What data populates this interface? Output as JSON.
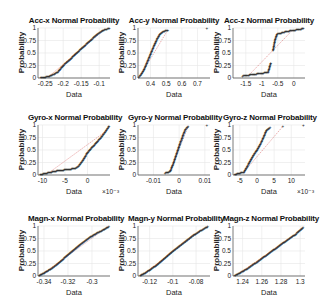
{
  "figure": {
    "background": "#ffffff",
    "grid_color": "#e6e6e6",
    "marker_color": "#222222",
    "ref_line_color": "#cc3333"
  },
  "chart_data": [
    {
      "type": "scatter",
      "title": "Acc-x Normal Probability",
      "xlabel": "Data",
      "ylabel": "Probability",
      "x_ticks": [
        "-0.25",
        "-0.2",
        "-0.15",
        "-0.1"
      ],
      "y_ticks": [
        "0",
        "0.25",
        "0.5",
        "0.75",
        "1"
      ],
      "xlim": [
        -0.27,
        -0.07
      ],
      "x_exponent": "",
      "grid": true,
      "points": [
        [
          -0.262,
          0.01
        ],
        [
          -0.24,
          0.03
        ],
        [
          -0.225,
          0.08
        ],
        [
          -0.215,
          0.12
        ],
        [
          -0.2,
          0.25
        ],
        [
          -0.18,
          0.38
        ],
        [
          -0.16,
          0.52
        ],
        [
          -0.14,
          0.65
        ],
        [
          -0.12,
          0.78
        ],
        [
          -0.105,
          0.88
        ],
        [
          -0.095,
          0.93
        ],
        [
          -0.085,
          0.97
        ],
        [
          -0.072,
          0.99
        ]
      ]
    },
    {
      "type": "scatter",
      "title": "Acc-y Normal Probability",
      "xlabel": "Data",
      "ylabel": "Probability",
      "x_ticks": [
        "0.4",
        "0.5",
        "0.6",
        "0.7"
      ],
      "y_ticks": [
        "0",
        "0.25",
        "0.5",
        "0.75",
        "1"
      ],
      "xlim": [
        0.32,
        0.78
      ],
      "x_exponent": "",
      "grid": true,
      "points": [
        [
          0.325,
          0.02
        ],
        [
          0.34,
          0.07
        ],
        [
          0.36,
          0.18
        ],
        [
          0.38,
          0.33
        ],
        [
          0.4,
          0.48
        ],
        [
          0.42,
          0.63
        ],
        [
          0.44,
          0.77
        ],
        [
          0.46,
          0.88
        ],
        [
          0.48,
          0.93
        ],
        [
          0.51,
          0.96
        ],
        [
          0.76,
          0.995
        ]
      ]
    },
    {
      "type": "scatter",
      "title": "Acc-z Normal Probability",
      "xlabel": "Data",
      "ylabel": "Probability",
      "x_ticks": [
        "-1.5",
        "-1",
        "-0.5",
        "0"
      ],
      "y_ticks": [
        "0",
        "0.25",
        "0.5",
        "0.75",
        "1"
      ],
      "xlim": [
        -1.9,
        0.35
      ],
      "x_exponent": "",
      "grid": true,
      "points": [
        [
          -1.6,
          0.04
        ],
        [
          -1.4,
          0.06
        ],
        [
          -1.2,
          0.08
        ],
        [
          -0.95,
          0.1
        ],
        [
          -0.8,
          0.12
        ],
        [
          -0.72,
          0.3
        ],
        [
          -0.65,
          0.55
        ],
        [
          -0.58,
          0.78
        ],
        [
          -0.52,
          0.88
        ],
        [
          -0.4,
          0.9
        ],
        [
          -0.25,
          0.93
        ],
        [
          -0.05,
          0.95
        ],
        [
          0.3,
          0.99
        ]
      ]
    },
    {
      "type": "scatter",
      "title": "Gyro-x Normal Probability",
      "xlabel": "Data",
      "ylabel": "Probability",
      "x_ticks": [
        "-10",
        "-5",
        "0"
      ],
      "y_ticks": [
        "0",
        "0.25",
        "0.5",
        "0.75",
        "1"
      ],
      "xlim": [
        -11,
        5
      ],
      "x_exponent": "×10⁻³",
      "grid": true,
      "points": [
        [
          -10.5,
          0.01
        ],
        [
          -8.5,
          0.05
        ],
        [
          -7,
          0.08
        ],
        [
          -5.5,
          0.1
        ],
        [
          -3.8,
          0.12
        ],
        [
          -2.8,
          0.13
        ],
        [
          -2,
          0.18
        ],
        [
          -1,
          0.3
        ],
        [
          0,
          0.45
        ],
        [
          1.5,
          0.6
        ],
        [
          3,
          0.75
        ],
        [
          4,
          0.87
        ],
        [
          4.8,
          0.98
        ]
      ]
    },
    {
      "type": "scatter",
      "title": "Gyro-y Normal Probability",
      "xlabel": "Data",
      "ylabel": "Probability",
      "x_ticks": [
        "-0.01",
        "0",
        "0.01"
      ],
      "y_ticks": [
        "0",
        "0.25",
        "0.5",
        "0.75",
        "1"
      ],
      "xlim": [
        -0.016,
        0.012
      ],
      "x_exponent": "",
      "grid": true,
      "points": [
        [
          -0.0055,
          0.04
        ],
        [
          -0.0035,
          0.07
        ],
        [
          -0.0025,
          0.2
        ],
        [
          -0.0015,
          0.35
        ],
        [
          -0.0005,
          0.5
        ],
        [
          0.0005,
          0.65
        ],
        [
          0.0015,
          0.8
        ],
        [
          0.0025,
          0.92
        ],
        [
          0.0035,
          0.97
        ],
        [
          0.0108,
          0.995
        ]
      ]
    },
    {
      "type": "scatter",
      "title": "Gyro-z Normal Probability",
      "xlabel": "Data",
      "ylabel": "Probability",
      "x_ticks": [
        "-5",
        "0",
        "5",
        "10"
      ],
      "y_ticks": [
        "0",
        "0.25",
        "0.5",
        "0.75",
        "1"
      ],
      "xlim": [
        -7,
        14
      ],
      "x_exponent": "×10⁻³",
      "grid": true,
      "points": [
        [
          -6.5,
          0.01
        ],
        [
          -3.8,
          0.06
        ],
        [
          -3,
          0.15
        ],
        [
          -2,
          0.28
        ],
        [
          -1,
          0.4
        ],
        [
          0,
          0.5
        ],
        [
          1,
          0.62
        ],
        [
          2,
          0.77
        ],
        [
          2.8,
          0.9
        ],
        [
          3.8,
          0.95
        ],
        [
          7.5,
          0.97
        ],
        [
          13.5,
          0.99
        ]
      ]
    },
    {
      "type": "scatter",
      "title": "Magn-x Normal Probability",
      "xlabel": "Data",
      "ylabel": "Probability",
      "x_ticks": [
        "-0.34",
        "-0.32",
        "-0.3"
      ],
      "y_ticks": [
        "0",
        "0.25",
        "0.5",
        "0.75",
        "1"
      ],
      "xlim": [
        -0.345,
        -0.285
      ],
      "x_exponent": "",
      "grid": true,
      "points": [
        [
          -0.344,
          0.01
        ],
        [
          -0.34,
          0.06
        ],
        [
          -0.335,
          0.13
        ],
        [
          -0.33,
          0.22
        ],
        [
          -0.325,
          0.32
        ],
        [
          -0.32,
          0.43
        ],
        [
          -0.315,
          0.53
        ],
        [
          -0.31,
          0.63
        ],
        [
          -0.305,
          0.72
        ],
        [
          -0.3,
          0.8
        ],
        [
          -0.295,
          0.87
        ],
        [
          -0.29,
          0.93
        ],
        [
          -0.286,
          0.99
        ]
      ]
    },
    {
      "type": "scatter",
      "title": "Magn-y Normal Probability",
      "xlabel": "Data",
      "ylabel": "Probability",
      "x_ticks": [
        "-0.12",
        "-0.1",
        "-0.08"
      ],
      "y_ticks": [
        "0",
        "0.25",
        "0.5",
        "0.75",
        "1"
      ],
      "xlim": [
        -0.13,
        -0.068
      ],
      "x_exponent": "",
      "grid": true,
      "points": [
        [
          -0.128,
          0.01
        ],
        [
          -0.124,
          0.06
        ],
        [
          -0.12,
          0.12
        ],
        [
          -0.115,
          0.2
        ],
        [
          -0.11,
          0.3
        ],
        [
          -0.105,
          0.4
        ],
        [
          -0.1,
          0.5
        ],
        [
          -0.095,
          0.59
        ],
        [
          -0.09,
          0.68
        ],
        [
          -0.085,
          0.77
        ],
        [
          -0.08,
          0.85
        ],
        [
          -0.075,
          0.92
        ],
        [
          -0.07,
          0.99
        ]
      ]
    },
    {
      "type": "scatter",
      "title": "Magn-z Normal Probability",
      "xlabel": "Data",
      "ylabel": "Probability",
      "x_ticks": [
        "1.24",
        "1.26",
        "1.28",
        "1.3"
      ],
      "y_ticks": [
        "0",
        "0.25",
        "0.5",
        "0.75",
        "1"
      ],
      "xlim": [
        1.23,
        1.305
      ],
      "x_exponent": "",
      "grid": true,
      "points": [
        [
          1.232,
          0.01
        ],
        [
          1.237,
          0.06
        ],
        [
          1.245,
          0.15
        ],
        [
          1.255,
          0.28
        ],
        [
          1.265,
          0.42
        ],
        [
          1.275,
          0.56
        ],
        [
          1.285,
          0.7
        ],
        [
          1.295,
          0.83
        ],
        [
          1.303,
          0.97
        ]
      ]
    }
  ]
}
